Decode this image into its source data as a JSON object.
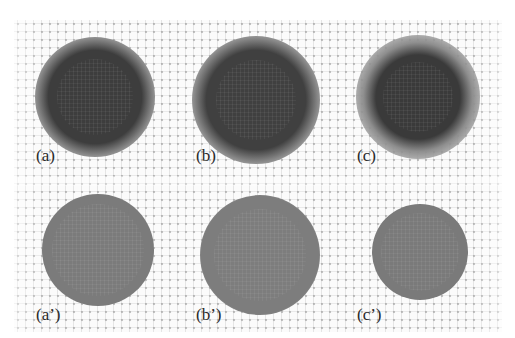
{
  "figure": {
    "layout": {
      "columns": 3,
      "rows": 2
    },
    "background": {
      "pattern": "faint-dot-cross-grid",
      "grid_color": "#c8c8c8"
    },
    "panels": [
      {
        "id": "a",
        "label": "(a)",
        "row": 0,
        "col": 0,
        "cx": 95,
        "cy": 97,
        "core_r": 38,
        "halo_r": 60,
        "core_color": "#3d3d3d",
        "halo_color": "#8a8a8a",
        "label_x": 36,
        "label_y": 147
      },
      {
        "id": "b",
        "label": "(b)",
        "row": 0,
        "col": 1,
        "cx": 256,
        "cy": 100,
        "core_r": 40,
        "halo_r": 64,
        "core_color": "#404040",
        "halo_color": "#8c8c8c",
        "label_x": 196,
        "label_y": 147
      },
      {
        "id": "c",
        "label": "(c)",
        "row": 0,
        "col": 2,
        "cx": 418,
        "cy": 97,
        "core_r": 35,
        "halo_r": 62,
        "core_color": "#3a3a3a",
        "halo_color": "#8e8e8e",
        "label_x": 357,
        "label_y": 147
      },
      {
        "id": "a2",
        "label": "(a’)",
        "row": 1,
        "col": 0,
        "cx": 98,
        "cy": 250,
        "core_r": 46,
        "halo_r": 56,
        "core_color": "#7b7b7b",
        "halo_color": "#a6a6a6",
        "label_x": 36,
        "label_y": 306
      },
      {
        "id": "b2",
        "label": "(b’)",
        "row": 1,
        "col": 1,
        "cx": 260,
        "cy": 255,
        "core_r": 46,
        "halo_r": 60,
        "core_color": "#7d7d7d",
        "halo_color": "#a8a8a8",
        "label_x": 196,
        "label_y": 306
      },
      {
        "id": "c2",
        "label": "(c’)",
        "row": 1,
        "col": 2,
        "cx": 420,
        "cy": 252,
        "core_r": 39,
        "halo_r": 48,
        "core_color": "#7a7a7a",
        "halo_color": "#a5a5a5",
        "label_x": 357,
        "label_y": 306
      }
    ]
  }
}
